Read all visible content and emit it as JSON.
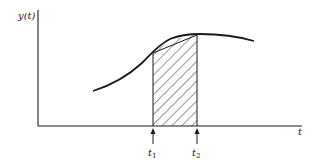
{
  "diagram": {
    "y_axis_label": "y(t)",
    "x_axis_label": "t",
    "markers": [
      {
        "label_main": "t",
        "label_sub": "1"
      },
      {
        "label_main": "t",
        "label_sub": "2"
      }
    ],
    "colors": {
      "ink": "#1a1a1a",
      "background": "#ffffff"
    }
  }
}
